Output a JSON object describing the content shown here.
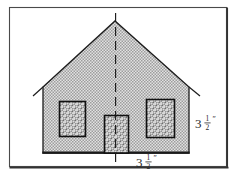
{
  "figure": {
    "kind": "geometry-diagram",
    "frame": {
      "border_color": "#3a3a3a",
      "background_color": "#ffffff"
    },
    "house": {
      "fill_color": "#b9b9b9",
      "fill_pattern": "fine-gray-checker-stipple",
      "outline_color": "#1a1a1a",
      "parts": [
        {
          "name": "gable-roof",
          "shape": "triangle"
        },
        {
          "name": "wall-body",
          "shape": "rectangle"
        },
        {
          "name": "left-eave",
          "shape": "line"
        },
        {
          "name": "right-eave",
          "shape": "line"
        },
        {
          "name": "baseline",
          "shape": "line"
        }
      ]
    },
    "openings": [
      {
        "name": "left-window",
        "shape": "rectangle",
        "fill_pattern": "coarse-gray-stipple",
        "outline_color": "#111111"
      },
      {
        "name": "front-door",
        "shape": "rectangle",
        "fill_pattern": "coarse-gray-stipple",
        "outline_color": "#111111"
      },
      {
        "name": "right-window",
        "shape": "rectangle",
        "fill_pattern": "coarse-gray-stipple",
        "outline_color": "#111111"
      }
    ],
    "symmetry_line": {
      "name": "line-of-symmetry",
      "orientation": "vertical",
      "style": "dashed",
      "color": "#1a1a1a"
    },
    "dimensions": [
      {
        "name": "height-label",
        "position": "right",
        "whole": "3",
        "numerator": "1",
        "denominator": "2",
        "unit": "″",
        "text": "3 1/2″"
      },
      {
        "name": "width-label",
        "position": "bottom",
        "whole": "3",
        "numerator": "1",
        "denominator": "2",
        "unit": "″",
        "text": "3 1/2″"
      }
    ]
  }
}
